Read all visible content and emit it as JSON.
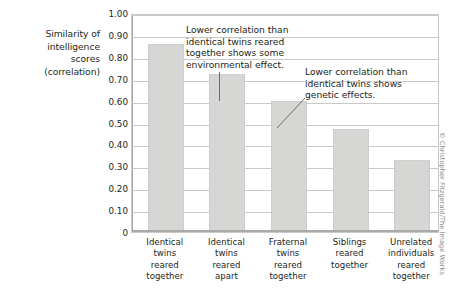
{
  "chart_data": {
    "type": "bar",
    "title": "",
    "xlabel": "",
    "ylabel": "Similarity of intelligence scores (correlation)",
    "ylim": [
      0,
      1.0
    ],
    "grid": true,
    "legend": "none",
    "categories": [
      "Identical twins reared together",
      "Identical twins reared apart",
      "Fraternal twins reared together",
      "Siblings reared together",
      "Unrelated individuals reared together"
    ],
    "values": [
      0.86,
      0.72,
      0.6,
      0.47,
      0.33
    ],
    "ytick_labels": [
      "1.00",
      "0.90",
      "0.80",
      "0.70",
      "0.60",
      "0.50",
      "0.40",
      "0.30",
      "0.20",
      "0.10",
      "0"
    ],
    "ytick_values": [
      1.0,
      0.9,
      0.8,
      0.7,
      0.6,
      0.5,
      0.4,
      0.3,
      0.2,
      0.1,
      0
    ],
    "bar_color": "#d6d6d4",
    "gridline_color": "#c9c9c7",
    "annotations": [
      {
        "id": "annotation-1",
        "lines": [
          "Lower correlation than",
          "identical twins reared",
          "together shows some",
          "environmental effect."
        ],
        "points_to": "Identical twins reared apart"
      },
      {
        "id": "annotation-2",
        "lines": [
          "Lower correlation than",
          "identical twins shows",
          "genetic effects."
        ],
        "points_to": "Fraternal twins reared together"
      }
    ]
  },
  "y_axis_title_lines": [
    "Similarity of",
    "intelligence",
    "scores",
    "(correlation)"
  ],
  "category_label_lines": [
    [
      "Identical",
      "twins",
      "reared",
      "together"
    ],
    [
      "Identical",
      "twins",
      "reared",
      "apart"
    ],
    [
      "Fraternal",
      "twins",
      "reared",
      "together"
    ],
    [
      "Siblings",
      "reared",
      "together"
    ],
    [
      "Unrelated",
      "individuals",
      "reared",
      "together"
    ]
  ],
  "credit": "© Christopher Fitzgerald/The Image Works"
}
